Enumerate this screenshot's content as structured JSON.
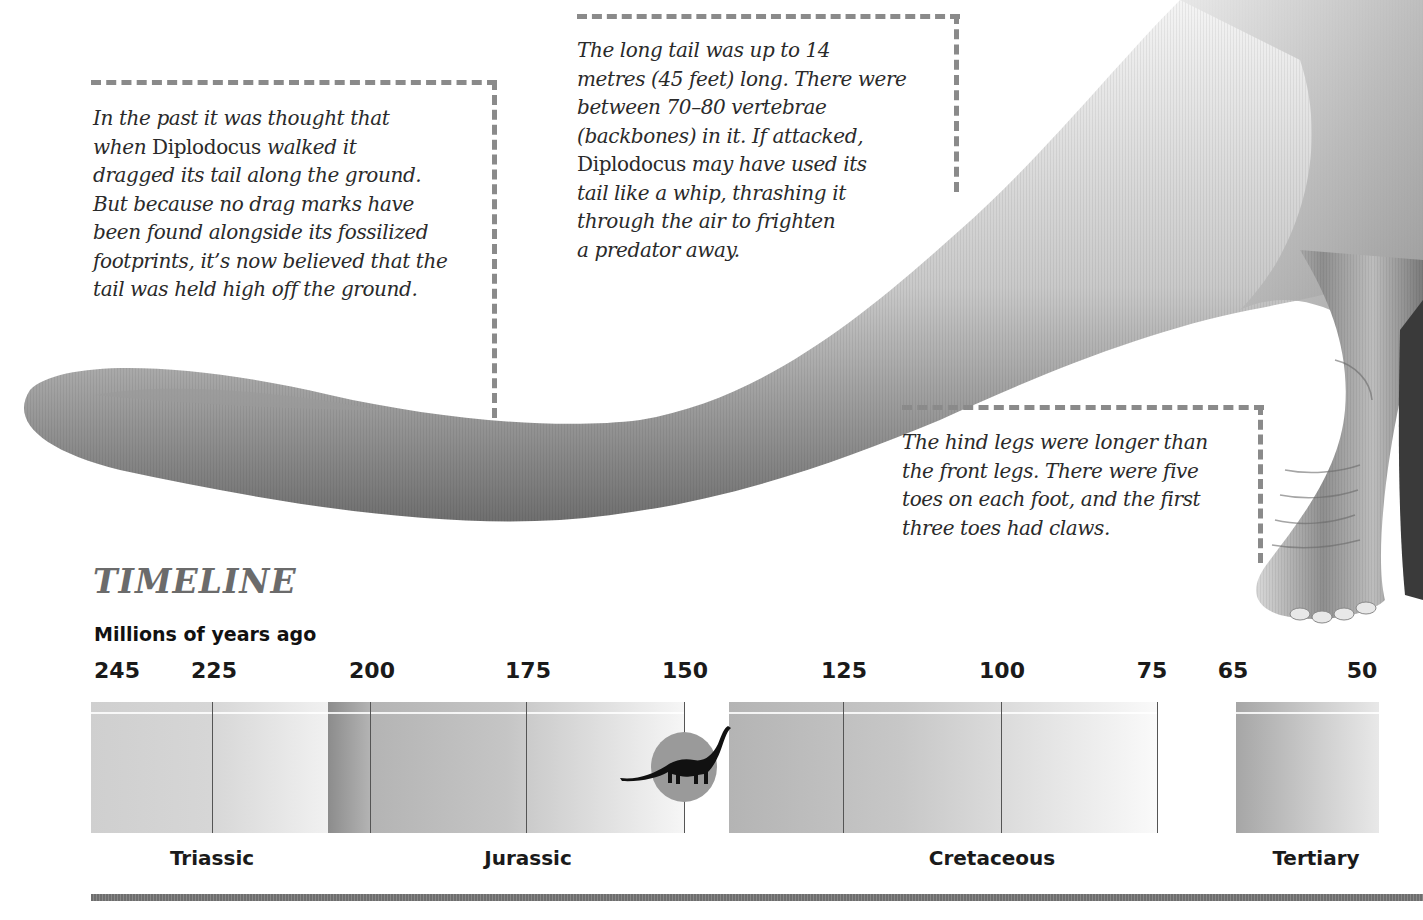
{
  "annotations": {
    "tail_posture": {
      "lines": [
        [
          "In the past it was thought that"
        ],
        [
          "when ",
          {
            "name": "Diplodocus"
          },
          " walked it"
        ],
        [
          "dragged its tail along the ground."
        ],
        [
          "But because no drag marks have"
        ],
        [
          "been found alongside its fossilized"
        ],
        [
          "footprints, it’s now believed that the"
        ],
        [
          "tail was held high off the ground."
        ]
      ],
      "text": "In the past it was thought that when Diplodocus walked it dragged its tail along the ground. But because no drag marks have been found alongside its fossilized footprints, it's now believed that the tail was held high off the ground."
    },
    "long_tail": {
      "lines": [
        [
          "The long tail was up to 14"
        ],
        [
          "metres (45 feet) long. There were"
        ],
        [
          "between 70–80 vertebrae"
        ],
        [
          "(backbones) in it. If attacked,"
        ],
        [
          {
            "name": "Diplodocus"
          },
          " may have used its"
        ],
        [
          "tail like a whip, thrashing it"
        ],
        [
          "through the air to frighten"
        ],
        [
          "a predator away."
        ]
      ],
      "text": "The long tail was up to 14 metres (45 feet) long. There were between 70–80 vertebrae (backbones) in it. If attacked, Diplodocus may have used its tail like a whip, thrashing it through the air to frighten a predator away."
    },
    "hind_legs": {
      "lines": [
        [
          "The hind legs were longer than"
        ],
        [
          "the front legs. There were five"
        ],
        [
          "toes on each foot, and the first"
        ],
        [
          "three toes had claws."
        ]
      ],
      "text": "The hind legs were longer than the front legs. There were five toes on each foot, and the first three toes had claws."
    }
  },
  "timeline": {
    "title": "TIMELINE",
    "axis_caption": "Millions of years ago",
    "ticks": [
      {
        "label": "245",
        "x": 117
      },
      {
        "label": "225",
        "x": 214
      },
      {
        "label": "200",
        "x": 372
      },
      {
        "label": "175",
        "x": 528
      },
      {
        "label": "150",
        "x": 685
      },
      {
        "label": "125",
        "x": 844
      },
      {
        "label": "100",
        "x": 1002
      },
      {
        "label": "75",
        "x": 1152
      },
      {
        "label": "65",
        "x": 1233
      },
      {
        "label": "50",
        "x": 1362
      }
    ],
    "periods": [
      {
        "label": "Triassic",
        "x": 212
      },
      {
        "label": "Jurassic",
        "x": 528
      },
      {
        "label": "Cretaceous",
        "x": 992
      },
      {
        "label": "Tertiary",
        "x": 1316
      }
    ],
    "marker": {
      "icon": "diplodocus-silhouette-icon",
      "era_mya": 150,
      "highlight_color": "#9a9a9a"
    }
  },
  "chart_data": {
    "type": "table",
    "title": "TIMELINE",
    "xlabel": "Millions of years ago",
    "tick_labels": [
      "245",
      "225",
      "200",
      "175",
      "150",
      "125",
      "100",
      "75",
      "65",
      "50"
    ],
    "periods": [
      {
        "name": "Triassic",
        "start_mya": 245,
        "end_mya": 200
      },
      {
        "name": "Jurassic",
        "start_mya": 200,
        "end_mya": 145
      },
      {
        "name": "Cretaceous",
        "start_mya": 145,
        "end_mya": 65
      },
      {
        "name": "Tertiary",
        "start_mya": 65,
        "end_mya": 50
      }
    ],
    "highlight": {
      "label": "Diplodocus",
      "mya": 150
    }
  },
  "colors": {
    "dashed_callout": "#8a8a8a",
    "title_gray": "#6b6b6b",
    "text": "#2a2a2a"
  }
}
